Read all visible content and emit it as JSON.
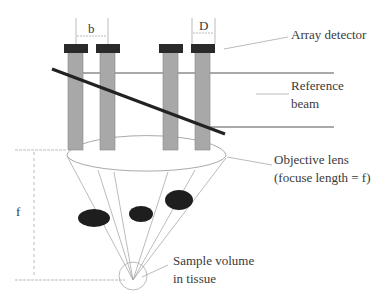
{
  "diagram": {
    "type": "optical-schematic",
    "labels": {
      "array_detector": "Array detector",
      "reference_line1": "Reference",
      "reference_line2": "beam",
      "objective_line1": "Objective lens",
      "objective_line2": "(focuse length = f)",
      "sample_line1": "Sample volume",
      "sample_line2": "in tissue",
      "dim_b": "b",
      "dim_D": "D",
      "dim_f": "f"
    },
    "colors": {
      "detector_cap": "#2a2a2a",
      "fiber": "#a8a8a8",
      "beam_splitter": "#222222",
      "lines": "#9a9a9a",
      "scatterer": "#1e1e1e"
    },
    "detector_count": 4,
    "scatterer_count": 3
  }
}
